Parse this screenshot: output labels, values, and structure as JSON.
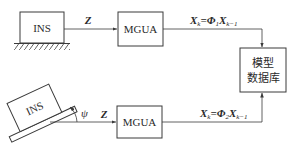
{
  "diagram": {
    "type": "block-flow",
    "colors": {
      "stroke": "#3a3a3a",
      "text": "#2a2a2a",
      "background": "#ffffff"
    },
    "top_row": {
      "ins_label": "INS",
      "ins_mount": "fixed-ground",
      "signal_label": "Z",
      "mgua_label": "MGUA",
      "formula": {
        "lhs": "X",
        "lhs_sub": "k",
        "eq": "=",
        "op": "Φ",
        "op_sub": "1",
        "rhs": "X",
        "rhs_sub": "k−1"
      }
    },
    "bottom_row": {
      "ins_label": "INS",
      "ins_mount": "tilted-platform",
      "angle_label": "ψ",
      "signal_label": "Z",
      "mgua_label": "MGUA",
      "formula": {
        "lhs": "X",
        "lhs_sub": "k",
        "eq": "=",
        "op": "Φ",
        "op_sub": "2",
        "rhs": "X",
        "rhs_sub": "k−1"
      }
    },
    "database": {
      "line1": "模型",
      "line2": "数据库"
    }
  }
}
